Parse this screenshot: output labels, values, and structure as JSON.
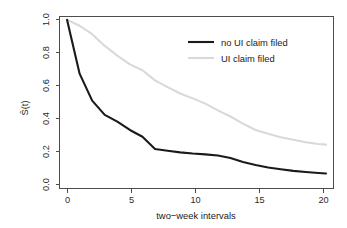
{
  "chart_data": {
    "type": "line",
    "title": "",
    "subtitle": "",
    "xlabel": "two−week intervals",
    "ylabel": "Ŝ(t)",
    "ylabel_plain": "S(t) with hat",
    "xlim": [
      -0.6,
      21.2
    ],
    "ylim": [
      0.0,
      1.02
    ],
    "xticks": [
      0,
      5,
      10,
      15,
      20
    ],
    "xticklabels": [
      "0",
      "5",
      "10",
      "15",
      "20"
    ],
    "yticks": [
      0.0,
      0.2,
      0.4,
      0.6,
      0.8,
      1.0
    ],
    "yticklabels": [
      "0.0",
      "0.2",
      "0.4",
      "0.6",
      "0.8",
      "1.0"
    ],
    "grid": false,
    "legend_position": "top-right-inside",
    "x": [
      0,
      1,
      2,
      3,
      4,
      5,
      6,
      7,
      8,
      9,
      10,
      11,
      12,
      13,
      14,
      15,
      16,
      17,
      18,
      19,
      20,
      20.6
    ],
    "series": [
      {
        "name": "no UI claim filed",
        "color": "#1a1a1a",
        "linewidth": 2.1,
        "values": [
          1.0,
          0.68,
          0.52,
          0.435,
          0.395,
          0.345,
          0.305,
          0.232,
          0.222,
          0.212,
          0.205,
          0.2,
          0.193,
          0.178,
          0.155,
          0.137,
          0.122,
          0.112,
          0.102,
          0.095,
          0.089,
          0.086
        ]
      },
      {
        "name": "UI claim filed",
        "color": "#d9d9d9",
        "linewidth": 2.1,
        "values": [
          1.0,
          0.965,
          0.915,
          0.845,
          0.787,
          0.735,
          0.7,
          0.64,
          0.6,
          0.562,
          0.533,
          0.502,
          0.462,
          0.425,
          0.383,
          0.345,
          0.322,
          0.302,
          0.287,
          0.272,
          0.262,
          0.258
        ]
      }
    ]
  },
  "legend": {
    "entries": [
      {
        "label": "no UI claim filed",
        "color": "#1a1a1a",
        "linewidth": 2.1
      },
      {
        "label": "UI claim filed",
        "color": "#d9d9d9",
        "linewidth": 2.1
      }
    ]
  },
  "axes": {
    "x_title": "two−week intervals",
    "y_title": "Ŝ(t)"
  }
}
